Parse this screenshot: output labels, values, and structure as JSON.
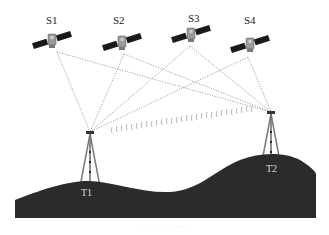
{
  "diagram": {
    "type": "GNSS relative positioning illustration",
    "satellites": [
      {
        "id": "S1",
        "label": "S1",
        "x": 52,
        "y": 40,
        "label_x": 53,
        "label_y": 24
      },
      {
        "id": "S2",
        "label": "S2",
        "x": 122,
        "y": 42,
        "label_x": 120,
        "label_y": 24
      },
      {
        "id": "S3",
        "label": "S3",
        "x": 191,
        "y": 34,
        "label_x": 196,
        "label_y": 22
      },
      {
        "id": "S4",
        "label": "S4",
        "x": 250,
        "y": 44,
        "label_x": 252,
        "label_y": 24
      }
    ],
    "stations": [
      {
        "id": "T1",
        "label": "T1",
        "x": 90,
        "y": 132,
        "label_x": 88,
        "label_y": 196
      },
      {
        "id": "T2",
        "label": "T2",
        "x": 271,
        "y": 112,
        "label_x": 273,
        "label_y": 172
      }
    ],
    "links": [
      {
        "from": "S1",
        "to": "T1"
      },
      {
        "from": "S2",
        "to": "T1"
      },
      {
        "from": "S3",
        "to": "T1"
      },
      {
        "from": "S4",
        "to": "T1"
      },
      {
        "from": "S1",
        "to": "T2"
      },
      {
        "from": "S2",
        "to": "T2"
      },
      {
        "from": "S3",
        "to": "T2"
      },
      {
        "from": "S4",
        "to": "T2"
      }
    ],
    "radio_link": {
      "from": "T1",
      "to": "T2",
      "style": "wave-marks"
    },
    "colors": {
      "ground": "#2b2b2b",
      "line": "#8a8a8a",
      "solar_panel": "#1a1a1a",
      "satellite_body": "#9a9a9a",
      "tripod": "#7a7a7a",
      "ground_label": "#d8d8d8"
    },
    "caption": "· · · · · · · · ·"
  }
}
